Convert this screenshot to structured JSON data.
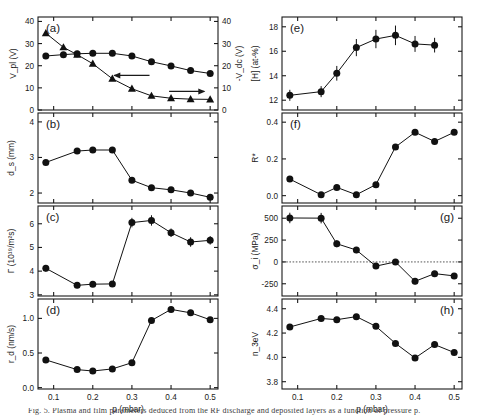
{
  "figure": {
    "title": "",
    "xlabel": "p (mbar)",
    "xticks": [
      "0.1",
      "0.2",
      "0.3",
      "0.4",
      "0.5"
    ],
    "caption": "Fig. 5. Plasma and film parameters deduced from the RF discharge and deposited layers as a function of pressure p.",
    "marker_colors": {
      "data": "#111111",
      "axis": "#1a1a1a",
      "zeroline": "#444444"
    }
  },
  "chart_data": [
    {
      "id": "a",
      "panel_label": "(a)",
      "type": "line",
      "title": "",
      "ylabel": "V$_{pl}$ (V)",
      "ylabel_text": "V_pl (V)",
      "ylabel_right_text": "-V_dc (V)",
      "xlabel": "",
      "xlim": [
        0.06,
        0.52
      ],
      "ylim": [
        0,
        42
      ],
      "yticks": [
        "0",
        "10",
        "20",
        "30",
        "40"
      ],
      "ytickvals": [
        0,
        10,
        20,
        30,
        40
      ],
      "y2lim": [
        0,
        42
      ],
      "y2ticks": [
        "0",
        "10",
        "20",
        "30",
        "40"
      ],
      "y2tickvals": [
        0,
        10,
        20,
        30,
        40
      ],
      "grid": false,
      "legend": "",
      "annotations": [
        {
          "text": "left-arrow",
          "name": "left-arrow-annotation"
        },
        {
          "text": "right-arrow",
          "name": "right-arrow-annotation"
        }
      ],
      "series": [
        {
          "name": "V_pl",
          "marker": "circle",
          "axis": "left",
          "x": [
            0.08,
            0.125,
            0.16,
            0.2,
            0.25,
            0.3,
            0.35,
            0.4,
            0.45,
            0.5
          ],
          "values": [
            24.4,
            25.0,
            25.4,
            25.6,
            25.6,
            24.4,
            21.8,
            19.9,
            17.8,
            16.5
          ]
        },
        {
          "name": "-V_dc",
          "marker": "triangle",
          "axis": "right",
          "x": [
            0.08,
            0.125,
            0.16,
            0.2,
            0.25,
            0.3,
            0.35,
            0.4,
            0.45,
            0.5
          ],
          "values": [
            34.7,
            28.3,
            25.0,
            20.9,
            14.1,
            9.6,
            6.4,
            5.3,
            4.9,
            4.8
          ]
        }
      ]
    },
    {
      "id": "b",
      "panel_label": "(b)",
      "type": "line",
      "ylabel_text": "d_s (mm)",
      "xlim": [
        0.06,
        0.52
      ],
      "ylim": [
        1.72,
        4.25
      ],
      "yticks": [
        "2",
        "3",
        "4"
      ],
      "ytickvals": [
        2,
        3,
        4
      ],
      "grid": false,
      "series": [
        {
          "name": "d_s",
          "marker": "circle",
          "x": [
            0.08,
            0.16,
            0.2,
            0.25,
            0.3,
            0.35,
            0.4,
            0.45,
            0.5
          ],
          "values": [
            2.86,
            3.18,
            3.21,
            3.21,
            2.36,
            2.15,
            2.09,
            2.0,
            1.88
          ]
        }
      ]
    },
    {
      "id": "c",
      "panel_label": "(c)",
      "type": "line",
      "ylabel_text": "Γ (10¹⁹/m²s)",
      "xlim": [
        0.06,
        0.52
      ],
      "ylim": [
        2.95,
        6.75
      ],
      "yticks": [
        "3",
        "4",
        "5",
        "6"
      ],
      "ytickvals": [
        3,
        4,
        5,
        6
      ],
      "grid": false,
      "series": [
        {
          "name": "Gamma",
          "marker": "circle",
          "errors": [
            0.14,
            0.12,
            0.12,
            0.12,
            0.2,
            0.22,
            0.18,
            0.2,
            0.18
          ],
          "x": [
            0.08,
            0.16,
            0.2,
            0.25,
            0.3,
            0.35,
            0.4,
            0.45,
            0.5
          ],
          "values": [
            4.12,
            3.4,
            3.45,
            3.46,
            6.05,
            6.14,
            5.62,
            5.23,
            5.3
          ]
        }
      ]
    },
    {
      "id": "d",
      "panel_label": "(d)",
      "type": "line",
      "ylabel_text": "r_d (nm/s)",
      "xlim": [
        0.06,
        0.52
      ],
      "ylim": [
        -0.02,
        1.28
      ],
      "yticks": [
        "0.0",
        "0.5",
        "1.0"
      ],
      "ytickvals": [
        0.0,
        0.5,
        1.0
      ],
      "grid": false,
      "series": [
        {
          "name": "r_d",
          "marker": "circle",
          "x": [
            0.08,
            0.16,
            0.2,
            0.25,
            0.3,
            0.35,
            0.4,
            0.45,
            0.5
          ],
          "values": [
            0.4,
            0.26,
            0.24,
            0.27,
            0.36,
            0.97,
            1.13,
            1.08,
            0.98
          ]
        }
      ]
    },
    {
      "id": "e",
      "panel_label": "(e)",
      "type": "line",
      "ylabel_text": "[H] (at-%)",
      "xlim": [
        0.06,
        0.52
      ],
      "ylim": [
        11.2,
        18.8
      ],
      "yticks": [
        "12",
        "14",
        "16",
        "18"
      ],
      "ytickvals": [
        12,
        14,
        16,
        18
      ],
      "grid": false,
      "series": [
        {
          "name": "H_content",
          "marker": "circle",
          "errors": [
            0.45,
            0.45,
            0.6,
            0.7,
            0.75,
            0.8,
            0.65,
            0.6
          ],
          "x": [
            0.08,
            0.16,
            0.2,
            0.25,
            0.3,
            0.35,
            0.4,
            0.45
          ],
          "values": [
            12.4,
            12.7,
            14.2,
            16.3,
            17.0,
            17.3,
            16.6,
            16.5
          ]
        }
      ]
    },
    {
      "id": "f",
      "panel_label": "(f)",
      "type": "line",
      "ylabel_text": "R*",
      "xlim": [
        0.06,
        0.52
      ],
      "ylim": [
        -0.04,
        0.45
      ],
      "yticks": [
        "0.0",
        "0.2",
        "0.4"
      ],
      "ytickvals": [
        0.0,
        0.2,
        0.4
      ],
      "grid": false,
      "series": [
        {
          "name": "R_star",
          "marker": "circle",
          "x": [
            0.08,
            0.16,
            0.2,
            0.25,
            0.3,
            0.35,
            0.4,
            0.45,
            0.5
          ],
          "values": [
            0.09,
            0.005,
            0.045,
            0.005,
            0.06,
            0.265,
            0.345,
            0.295,
            0.345
          ]
        }
      ]
    },
    {
      "id": "g",
      "panel_label": "(g)",
      "type": "line",
      "ylabel_text": "σ_i (MPa)",
      "xlim": [
        0.06,
        0.52
      ],
      "ylim": [
        -390,
        640
      ],
      "yticks": [
        "-250",
        "0",
        "250",
        "500"
      ],
      "ytickvals": [
        -250,
        0,
        250,
        500
      ],
      "grid": false,
      "zeroline": 0,
      "series": [
        {
          "name": "sigma_i",
          "marker": "circle",
          "errors": [
            60,
            60,
            40,
            35,
            30,
            30,
            35,
            30,
            30
          ],
          "x": [
            0.08,
            0.16,
            0.2,
            0.25,
            0.3,
            0.35,
            0.4,
            0.45,
            0.5
          ],
          "values": [
            503,
            501,
            208,
            136,
            -48,
            0,
            -222,
            -134,
            -160
          ]
        }
      ]
    },
    {
      "id": "h",
      "panel_label": "(h)",
      "type": "line",
      "ylabel_text": "n_3eV",
      "xlim": [
        0.06,
        0.52
      ],
      "ylim": [
        3.74,
        4.48
      ],
      "yticks": [
        "3.8",
        "4.0",
        "4.2",
        "4.4"
      ],
      "ytickvals": [
        3.8,
        4.0,
        4.2,
        4.4
      ],
      "grid": false,
      "series": [
        {
          "name": "n_3eV",
          "marker": "circle",
          "x": [
            0.08,
            0.16,
            0.2,
            0.25,
            0.3,
            0.35,
            0.4,
            0.45,
            0.5
          ],
          "values": [
            4.25,
            4.32,
            4.31,
            4.335,
            4.255,
            4.115,
            3.995,
            4.105,
            4.04
          ]
        }
      ]
    }
  ]
}
